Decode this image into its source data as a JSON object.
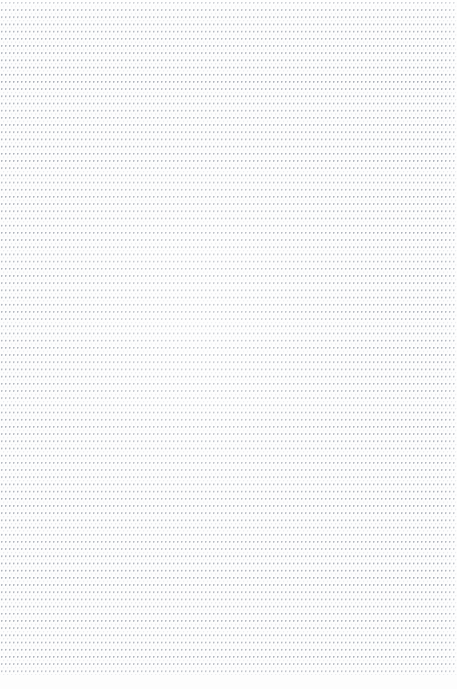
{
  "page": {
    "kind": "dot-grid-notebook-page",
    "width_px": 457,
    "height_px": 689,
    "has_text_content": false,
    "has_handwriting": false,
    "has_ui_chrome": false,
    "visible_text": ""
  },
  "paper": {
    "background_color": "#fdfdfd",
    "bottom_margin_px": 14
  },
  "grid": {
    "style": "dotted",
    "dot_color": "#b8bcc4",
    "dot_diameter_px": 1,
    "column_spacing_px": 4,
    "row_spacing_px": 7.2,
    "origin_x_px": 1,
    "origin_y_px": 2,
    "extent_width_px": 457,
    "extent_height_px": 675,
    "approx_columns": 114,
    "approx_rows": 94
  },
  "scan": {
    "artifacts": "faint horizontal banding and uneven illumination",
    "top_edge_washout": true,
    "right_edge_fade": true
  }
}
